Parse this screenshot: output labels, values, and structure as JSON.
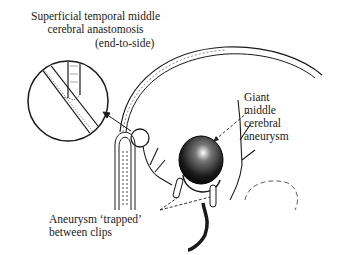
{
  "figure": {
    "labels": {
      "anastomosis": {
        "line1": "Superficial temporal middle",
        "line2": "cerebral anastomosis",
        "line3": "(end-to-side)"
      },
      "aneurysm": {
        "line1": "Giant",
        "line2": "middle",
        "line3": "cerebral",
        "line4": "aneurysm"
      },
      "trapped": {
        "line1": "Aneurysm ‘trapped’",
        "line2": "between clips"
      }
    },
    "colors": {
      "ink": "#1a1a1a",
      "background": "#ffffff"
    }
  }
}
